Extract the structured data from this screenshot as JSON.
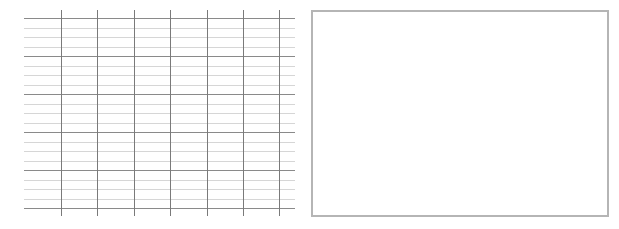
{
  "grid": {
    "x_start": 24,
    "x_end": 295,
    "y_top": 10,
    "y_bottom": 216,
    "major_rows_y": [
      18,
      56,
      94,
      132,
      170,
      208
    ],
    "minor_subdivisions": 4,
    "columns_x": [
      61,
      97,
      134,
      170,
      207,
      243,
      279
    ],
    "major_color": "#8a8a8a",
    "minor_color": "#d6d6d6",
    "vertical_color": "#7a7a7a"
  },
  "blank_panel": {
    "left": 311,
    "top": 10,
    "width": 298,
    "height": 207,
    "border_color": "#b5b5b5"
  }
}
